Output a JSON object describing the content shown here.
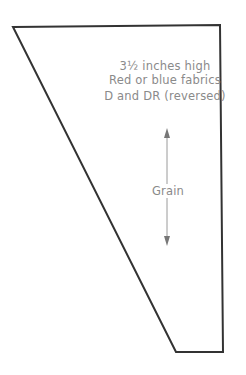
{
  "diagram": {
    "type": "quilt-template-piece",
    "shape": "trapezoid",
    "labels": {
      "height": "3½ inches high",
      "fabrics": "Red or blue fabrics",
      "piece": "D and DR (reversed)",
      "grain": "Grain"
    },
    "colors": {
      "outline": "#333333",
      "text": "#8a8a8a",
      "grain_line": "#9a9a9a"
    }
  }
}
